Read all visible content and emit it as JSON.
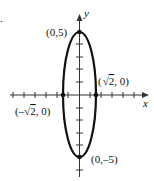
{
  "problem_marker": ".",
  "axes": {
    "x_label": "x",
    "y_label": "y"
  },
  "points": {
    "top": {
      "label": "(0,5)",
      "x": 0,
      "y": 5
    },
    "bottom": {
      "label": "(0,–5)",
      "x": 0,
      "y": -5
    },
    "right": {
      "label_prefix": "(",
      "label_root": "2",
      "label_suffix": ", 0)",
      "x": "√2",
      "y": 0
    },
    "left": {
      "label_prefix": "(–",
      "label_root": "2",
      "label_suffix": ", 0)",
      "x": "-√2",
      "y": 0
    }
  },
  "curve": {
    "type": "ellipse",
    "equation": "x^2/2 + y^2/25 = 1",
    "center": [
      0,
      0
    ],
    "semi_major_y": 5,
    "semi_minor_x": "√2"
  },
  "colors": {
    "ink": "#111111",
    "axis": "#333333",
    "background": "#ffffff"
  }
}
